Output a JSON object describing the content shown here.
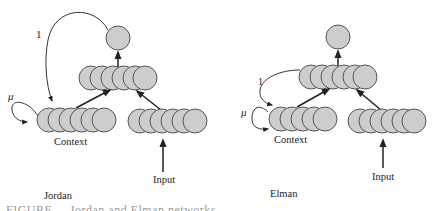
{
  "diagram": {
    "colors": {
      "node_fill": "#cdcdcd",
      "node_stroke": "#555555",
      "arrow": "#222222",
      "text": "#222222"
    },
    "panels": [
      {
        "name": "Jordan",
        "title": "Jordan",
        "context_label": "Context",
        "input_label": "Input",
        "feedback_label": "1",
        "self_loop_label": "μ",
        "feedback_source": "output",
        "layers": {
          "output": 1,
          "hidden": 6,
          "context": 6,
          "input": 6
        }
      },
      {
        "name": "Elman",
        "title": "Elman",
        "context_label": "Context",
        "input_label": "Input",
        "feedback_label": "1",
        "self_loop_label": "μ",
        "feedback_source": "hidden",
        "layers": {
          "output": 1,
          "hidden": 6,
          "context": 5,
          "input": 6
        }
      }
    ],
    "caption": "FIGURE ... Jordan and Elman networks"
  }
}
